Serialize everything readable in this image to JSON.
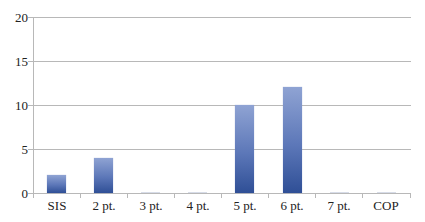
{
  "chart_data": {
    "type": "bar",
    "title": "",
    "xlabel": "",
    "ylabel": "",
    "categories": [
      "SIS",
      "2 pt.",
      "3 pt.",
      "4 pt.",
      "5 pt.",
      "6 pt.",
      "7 pt.",
      "COP"
    ],
    "values": [
      2,
      4,
      0,
      0,
      10,
      12,
      0,
      0
    ],
    "ylim": [
      0,
      20
    ],
    "yticks": [
      "0",
      "5",
      "10",
      "15",
      "20"
    ],
    "grid": true,
    "legend": null,
    "bar_color": "#4a67ad"
  }
}
